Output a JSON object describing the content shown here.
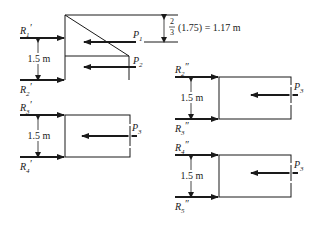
{
  "diagram": {
    "type": "free-body force diagrams",
    "panels": [
      {
        "id": "top-left",
        "reactions": [
          {
            "name": "R",
            "sub": "1",
            "prime": "′"
          },
          {
            "name": "R",
            "sub": "2",
            "prime": "′"
          }
        ],
        "loads": [
          {
            "name": "P",
            "sub": "1"
          },
          {
            "name": "P",
            "sub": "2"
          }
        ],
        "spacing": "1.5 m",
        "height_annotation": "(1.75) = 1.17 m",
        "fraction": {
          "num": "2",
          "den": "3"
        }
      },
      {
        "id": "mid-left",
        "reactions": [
          {
            "name": "R",
            "sub": "3",
            "prime": "′"
          },
          {
            "name": "R",
            "sub": "4",
            "prime": "′"
          }
        ],
        "loads": [
          {
            "name": "P",
            "sub": "3"
          }
        ],
        "spacing": "1.5 m"
      },
      {
        "id": "mid-right",
        "reactions": [
          {
            "name": "R",
            "sub": "2",
            "prime": "″"
          },
          {
            "name": "R",
            "sub": "3",
            "prime": "″"
          }
        ],
        "loads": [
          {
            "name": "P",
            "sub": "3"
          }
        ],
        "spacing": "1.5 m"
      },
      {
        "id": "bottom-right",
        "reactions": [
          {
            "name": "R",
            "sub": "4",
            "prime": "″"
          },
          {
            "name": "R",
            "sub": "5",
            "prime": "″"
          }
        ],
        "loads": [
          {
            "name": "P",
            "sub": "3"
          }
        ],
        "spacing": "1.5 m"
      }
    ]
  }
}
